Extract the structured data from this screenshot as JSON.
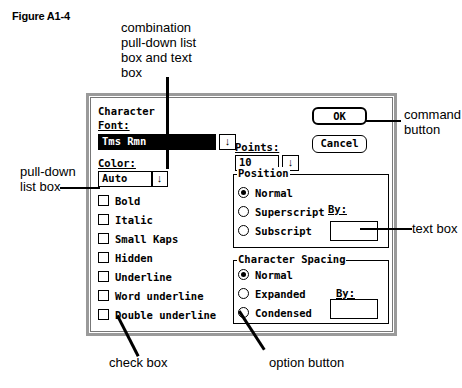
{
  "figure": {
    "title": "Figure A1-4"
  },
  "callouts": {
    "combo": [
      "combination",
      "pull-down list",
      "box and text",
      "box"
    ],
    "command_button": [
      "command",
      "button"
    ],
    "pulldown": [
      "pull-down",
      "list box"
    ],
    "text_box": "text box",
    "check_box": "check box",
    "option_button": "option button"
  },
  "dialog": {
    "title": "Character",
    "font": {
      "label": "Font:",
      "value": "Tms Rmn",
      "arrow": "↓"
    },
    "points": {
      "label": "Points:",
      "value": "10",
      "arrow": "↓"
    },
    "color": {
      "label": "Color:",
      "value": "Auto",
      "arrow": "↓"
    },
    "buttons": {
      "ok": "OK",
      "cancel": "Cancel"
    },
    "checkboxes": [
      {
        "label": "Bold",
        "checked": false
      },
      {
        "label": "Italic",
        "checked": false
      },
      {
        "label": "Small Kaps",
        "checked": false
      },
      {
        "label": "Hidden",
        "checked": false
      },
      {
        "label": "Underline",
        "checked": false
      },
      {
        "label": "Word underline",
        "checked": false
      },
      {
        "label": "Double underline",
        "checked": false
      }
    ],
    "position": {
      "legend": "Position",
      "options": [
        {
          "label": "Normal",
          "selected": true
        },
        {
          "label": "Superscript",
          "selected": false
        },
        {
          "label": "Subscript",
          "selected": false
        }
      ],
      "by_label": "By:",
      "by_value": ""
    },
    "spacing": {
      "legend": "Character Spacing",
      "options": [
        {
          "label": "Normal",
          "selected": true
        },
        {
          "label": "Expanded",
          "selected": false
        },
        {
          "label": "Condensed",
          "selected": false
        }
      ],
      "by_label": "By:",
      "by_value": ""
    }
  }
}
